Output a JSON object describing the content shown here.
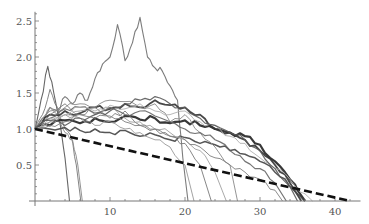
{
  "chart_data": {
    "type": "line",
    "title": "",
    "xlabel": "",
    "ylabel": "",
    "xlim": [
      0,
      43
    ],
    "ylim": [
      0,
      2.6
    ],
    "grid": false,
    "legend": "none",
    "x_ticks": [
      10,
      20,
      30,
      40
    ],
    "x_tick_labels": [
      "10",
      "20",
      "30",
      "40"
    ],
    "y_ticks": [
      0.5,
      1.0,
      1.5,
      2.0,
      2.5
    ],
    "y_tick_labels": [
      "0.5",
      "1.0",
      "1.5",
      "2.0",
      "2.5"
    ],
    "reference_line": {
      "name": "linear decline",
      "style": "dashed",
      "color": "#111111",
      "x": [
        0,
        42
      ],
      "y": [
        1.0,
        0.0
      ]
    },
    "series": [
      {
        "name": "path-1",
        "color": "#6e6e6e",
        "width": 1.1,
        "x": [
          0,
          1,
          2,
          3,
          4,
          5,
          6,
          7,
          8,
          9,
          10,
          11,
          12,
          13,
          14,
          15,
          16,
          17,
          18,
          19,
          19.7,
          20.4
        ],
        "y": [
          1.0,
          1.15,
          1.3,
          1.25,
          1.45,
          1.35,
          1.5,
          1.4,
          1.7,
          1.9,
          2.0,
          2.45,
          1.95,
          2.2,
          2.55,
          2.0,
          1.85,
          1.8,
          1.6,
          1.4,
          0.6,
          0.0
        ]
      },
      {
        "name": "path-2",
        "color": "#555555",
        "width": 1.1,
        "x": [
          0,
          0.8,
          1.7,
          2.5,
          3.3,
          4.0,
          4.6
        ],
        "y": [
          1.0,
          1.4,
          1.87,
          1.5,
          1.1,
          0.6,
          0.0
        ]
      },
      {
        "name": "path-3",
        "color": "#777777",
        "width": 1.0,
        "x": [
          0,
          1,
          2,
          3,
          4,
          4.8,
          5.5,
          6.1
        ],
        "y": [
          1.0,
          1.2,
          1.55,
          1.3,
          1.0,
          0.9,
          0.5,
          0.0
        ]
      },
      {
        "name": "path-4",
        "color": "#888888",
        "width": 1.0,
        "x": [
          0,
          1,
          2,
          3,
          4,
          5,
          5.7,
          6.3
        ],
        "y": [
          1.0,
          1.1,
          1.3,
          1.2,
          0.95,
          0.85,
          0.5,
          0.0
        ]
      },
      {
        "name": "path-5",
        "color": "#222222",
        "width": 2.2,
        "x": [
          0,
          2,
          4,
          6,
          8,
          10,
          12,
          14,
          16,
          18,
          20,
          22,
          24,
          26,
          28,
          30,
          32,
          34,
          35,
          36
        ],
        "y": [
          1.0,
          1.05,
          1.12,
          1.08,
          1.15,
          1.1,
          1.18,
          1.13,
          1.15,
          1.08,
          1.12,
          1.05,
          1.0,
          0.95,
          0.9,
          0.78,
          0.55,
          0.3,
          0.15,
          0.0
        ]
      },
      {
        "name": "path-6",
        "color": "#333333",
        "width": 1.8,
        "x": [
          0,
          2,
          4,
          6,
          8,
          10,
          12,
          14,
          16,
          18,
          20,
          22,
          24,
          26,
          28,
          30,
          32,
          34,
          35.5
        ],
        "y": [
          1.0,
          1.2,
          1.25,
          1.22,
          1.3,
          1.28,
          1.35,
          1.3,
          1.4,
          1.33,
          1.3,
          1.2,
          1.0,
          0.95,
          0.85,
          0.7,
          0.5,
          0.25,
          0.0
        ]
      },
      {
        "name": "path-7",
        "color": "#444444",
        "width": 1.5,
        "x": [
          0,
          2,
          4,
          6,
          8,
          10,
          12,
          14,
          16,
          18,
          20,
          22,
          24,
          26,
          28,
          30,
          32,
          34,
          36
        ],
        "y": [
          1.0,
          1.0,
          1.02,
          0.98,
          1.0,
          0.95,
          0.98,
          0.9,
          0.92,
          0.85,
          0.88,
          0.8,
          0.78,
          0.7,
          0.65,
          0.55,
          0.4,
          0.2,
          0.0
        ]
      },
      {
        "name": "path-8",
        "color": "#8a8a8a",
        "width": 1.0,
        "x": [
          0,
          2,
          4,
          6,
          8,
          10,
          12,
          14,
          16,
          18,
          20,
          22,
          24,
          26,
          27
        ],
        "y": [
          1.0,
          1.25,
          1.3,
          1.35,
          1.3,
          1.4,
          1.38,
          1.3,
          1.35,
          1.1,
          1.2,
          0.95,
          0.75,
          0.5,
          0.0
        ]
      },
      {
        "name": "path-9",
        "color": "#999999",
        "width": 1.0,
        "x": [
          0,
          2,
          4,
          6,
          8,
          10,
          12,
          14,
          16,
          18,
          20,
          21.2
        ],
        "y": [
          1.0,
          1.1,
          1.2,
          1.15,
          1.05,
          1.1,
          1.0,
          0.95,
          0.85,
          0.75,
          0.5,
          0.0
        ]
      },
      {
        "name": "path-10",
        "color": "#7a7a7a",
        "width": 1.0,
        "x": [
          0,
          2,
          4,
          6,
          8,
          10,
          12,
          14,
          16,
          18,
          20,
          22,
          23.5
        ],
        "y": [
          1.0,
          1.2,
          1.35,
          1.2,
          1.3,
          1.15,
          1.25,
          1.05,
          1.0,
          0.9,
          0.8,
          0.5,
          0.0
        ]
      },
      {
        "name": "path-11",
        "color": "#a0a0a0",
        "width": 1.0,
        "x": [
          0,
          2,
          4,
          6,
          8,
          10,
          12,
          14,
          16,
          18,
          20,
          22,
          24,
          25.5
        ],
        "y": [
          1.0,
          1.1,
          1.2,
          1.25,
          1.2,
          1.3,
          1.15,
          1.1,
          1.0,
          0.95,
          0.85,
          0.7,
          0.4,
          0.0
        ]
      },
      {
        "name": "path-12",
        "color": "#666666",
        "width": 1.2,
        "x": [
          0,
          2,
          4,
          6,
          8,
          10,
          12,
          14,
          16,
          18,
          20,
          22,
          24,
          26,
          28,
          30,
          32,
          33.5
        ],
        "y": [
          1.0,
          1.15,
          1.28,
          1.3,
          1.22,
          1.3,
          1.2,
          1.25,
          1.18,
          1.1,
          1.0,
          0.95,
          0.85,
          0.7,
          0.55,
          0.45,
          0.25,
          0.0
        ]
      },
      {
        "name": "path-13",
        "color": "#b0b0b0",
        "width": 1.0,
        "x": [
          0,
          2,
          4,
          6,
          8,
          10,
          12,
          14,
          16,
          18,
          20,
          22,
          24,
          26,
          28,
          30,
          32,
          34,
          36,
          37
        ],
        "y": [
          1.0,
          1.15,
          1.2,
          1.3,
          1.25,
          1.33,
          1.28,
          1.35,
          1.25,
          1.2,
          1.25,
          1.1,
          1.05,
          0.9,
          0.8,
          0.6,
          0.45,
          0.3,
          0.1,
          0.0
        ]
      },
      {
        "name": "path-14",
        "color": "#5a5a5a",
        "width": 1.2,
        "x": [
          0,
          2,
          4,
          6,
          8,
          10,
          12,
          14,
          16,
          18,
          20,
          22,
          24,
          26,
          28,
          30,
          32,
          34,
          35
        ],
        "y": [
          1.0,
          1.12,
          1.05,
          1.15,
          1.2,
          1.25,
          1.35,
          1.4,
          1.45,
          1.35,
          1.3,
          1.15,
          1.05,
          0.95,
          0.85,
          0.7,
          0.45,
          0.2,
          0.0
        ]
      },
      {
        "name": "path-15",
        "color": "#7f7f7f",
        "width": 1.0,
        "x": [
          0,
          2,
          4,
          6,
          8,
          10,
          12,
          14,
          16,
          18,
          20,
          22,
          24,
          26,
          28,
          30,
          32,
          33
        ],
        "y": [
          1.0,
          1.05,
          1.1,
          1.2,
          1.15,
          1.18,
          1.1,
          1.05,
          1.0,
          0.9,
          0.85,
          0.75,
          0.6,
          0.5,
          0.4,
          0.3,
          0.15,
          0.0
        ]
      }
    ]
  }
}
